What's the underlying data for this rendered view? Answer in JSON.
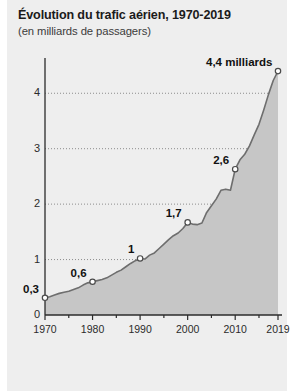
{
  "header": {
    "title": "Évolution du trafic aérien, 1970-2019",
    "subtitle": "(en milliards de passagers)"
  },
  "colors": {
    "panel_background": "#eeeeee",
    "area_fill": "#c6c6c6",
    "line": "#6e6e6e",
    "axis": "#2b2b2b",
    "gridline": "#8c8c8c",
    "marker_fill": "#ffffff",
    "text": "#1b1b1b"
  },
  "chart_data": {
    "type": "area",
    "title": "Évolution du trafic aérien, 1970-2019",
    "subtitle": "(en milliards de passagers)",
    "xlabel": "",
    "ylabel": "",
    "xlim": [
      1970,
      2019
    ],
    "ylim": [
      0,
      4.6
    ],
    "grid": true,
    "gridlines_y": [
      1,
      2,
      3,
      4
    ],
    "legend": "none",
    "yticks": [
      "0",
      "1",
      "2",
      "3",
      "4"
    ],
    "ytick_values": [
      0,
      1,
      2,
      3,
      4
    ],
    "xticks": [
      "1970",
      "1980",
      "1990",
      "2000",
      "2010",
      "2019"
    ],
    "xtick_values": [
      1970,
      1980,
      1990,
      2000,
      2010,
      2019
    ],
    "xminor_step": 5,
    "x": [
      1970,
      1971,
      1972,
      1973,
      1974,
      1975,
      1976,
      1977,
      1978,
      1979,
      1980,
      1981,
      1982,
      1983,
      1984,
      1985,
      1986,
      1987,
      1988,
      1989,
      1990,
      1991,
      1992,
      1993,
      1994,
      1995,
      1996,
      1997,
      1998,
      1999,
      2000,
      2001,
      2002,
      2003,
      2004,
      2005,
      2006,
      2007,
      2008,
      2009,
      2010,
      2011,
      2012,
      2013,
      2014,
      2015,
      2016,
      2017,
      2018,
      2019
    ],
    "values": [
      0.31,
      0.33,
      0.36,
      0.39,
      0.41,
      0.43,
      0.46,
      0.49,
      0.54,
      0.58,
      0.6,
      0.62,
      0.64,
      0.67,
      0.72,
      0.77,
      0.81,
      0.87,
      0.93,
      0.98,
      1.02,
      1.01,
      1.08,
      1.12,
      1.2,
      1.28,
      1.36,
      1.43,
      1.48,
      1.56,
      1.67,
      1.64,
      1.63,
      1.66,
      1.85,
      1.97,
      2.09,
      2.25,
      2.27,
      2.25,
      2.63,
      2.8,
      2.9,
      3.05,
      3.25,
      3.44,
      3.7,
      3.98,
      4.23,
      4.4
    ],
    "annotations": [
      {
        "label": "0,3",
        "x": 1970,
        "y": 0.31,
        "marker": true
      },
      {
        "label": "0,6",
        "x": 1980,
        "y": 0.6,
        "marker": true
      },
      {
        "label": "1",
        "x": 1990,
        "y": 1.02,
        "marker": true
      },
      {
        "label": "1,7",
        "x": 2000,
        "y": 1.67,
        "marker": true
      },
      {
        "label": "2,6",
        "x": 2010,
        "y": 2.63,
        "marker": true
      },
      {
        "label": "4,4 milliards",
        "x": 2019,
        "y": 4.4,
        "marker": true
      }
    ]
  }
}
